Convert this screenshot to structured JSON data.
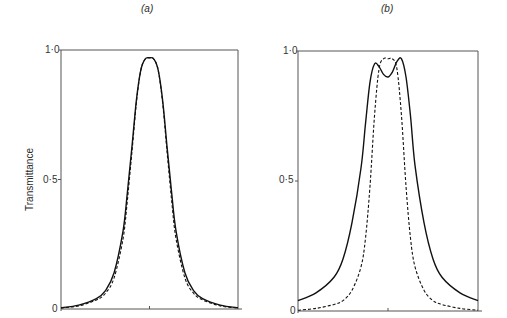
{
  "chart_data": [
    {
      "type": "line",
      "panel": "(a)",
      "title": "(a)",
      "xlabel": "",
      "ylabel": "Transmittance",
      "ylim": [
        0,
        1.0
      ],
      "yticks": [
        "0",
        "0.5",
        "1.0"
      ],
      "ytick_labels_rendered": [
        "0",
        "0·5",
        "1·0"
      ],
      "xticks": [
        "center"
      ],
      "grid": false,
      "legend": null,
      "x": [
        -1.0,
        -0.8,
        -0.6,
        -0.5,
        -0.4,
        -0.3,
        -0.25,
        -0.2,
        -0.15,
        -0.1,
        -0.05,
        0.0,
        0.05,
        0.1,
        0.15,
        0.2,
        0.25,
        0.3,
        0.4,
        0.5,
        0.6,
        0.8,
        1.0
      ],
      "series": [
        {
          "name": "solid",
          "style": "solid",
          "values": [
            0.005,
            0.015,
            0.04,
            0.07,
            0.14,
            0.3,
            0.45,
            0.62,
            0.8,
            0.92,
            0.965,
            0.97,
            0.965,
            0.92,
            0.8,
            0.62,
            0.45,
            0.3,
            0.14,
            0.07,
            0.04,
            0.015,
            0.005
          ]
        },
        {
          "name": "dashed",
          "style": "dashed",
          "values": [
            0.004,
            0.012,
            0.035,
            0.06,
            0.12,
            0.27,
            0.42,
            0.6,
            0.79,
            0.92,
            0.965,
            0.97,
            0.965,
            0.92,
            0.79,
            0.6,
            0.42,
            0.27,
            0.12,
            0.06,
            0.035,
            0.012,
            0.004
          ]
        }
      ]
    },
    {
      "type": "line",
      "panel": "(b)",
      "title": "(b)",
      "xlabel": "",
      "ylabel": "",
      "ylim": [
        0,
        1.0
      ],
      "yticks": [
        "0",
        "0.5",
        "1.0"
      ],
      "ytick_labels_rendered": [
        "0",
        "0·5",
        "1·0"
      ],
      "xticks": [
        "center"
      ],
      "grid": false,
      "legend": null,
      "x": [
        -1.0,
        -0.8,
        -0.6,
        -0.5,
        -0.4,
        -0.3,
        -0.25,
        -0.2,
        -0.15,
        -0.1,
        -0.05,
        0.0,
        0.05,
        0.1,
        0.15,
        0.2,
        0.25,
        0.3,
        0.4,
        0.5,
        0.6,
        0.8,
        1.0
      ],
      "series": [
        {
          "name": "solid",
          "style": "solid",
          "values": [
            0.04,
            0.07,
            0.13,
            0.2,
            0.34,
            0.55,
            0.72,
            0.88,
            0.95,
            0.94,
            0.91,
            0.9,
            0.92,
            0.96,
            0.97,
            0.9,
            0.75,
            0.56,
            0.34,
            0.2,
            0.13,
            0.07,
            0.04
          ]
        },
        {
          "name": "dashed",
          "style": "dashed",
          "values": [
            0.003,
            0.01,
            0.025,
            0.04,
            0.08,
            0.17,
            0.28,
            0.48,
            0.75,
            0.93,
            0.97,
            0.97,
            0.97,
            0.93,
            0.75,
            0.48,
            0.28,
            0.17,
            0.08,
            0.04,
            0.025,
            0.01,
            0.003
          ]
        }
      ]
    }
  ],
  "labels": {
    "panel_a": "(a)",
    "panel_b": "(b)",
    "ylabel": "Transmittance",
    "a_y0": "0",
    "a_y05": "0·5",
    "a_y10": "1·0",
    "b_y0": "0",
    "b_y05": "0·5",
    "b_y10": "1·0"
  },
  "colors": {
    "line": "#111111",
    "axis": "#555555",
    "background": "#ffffff"
  }
}
